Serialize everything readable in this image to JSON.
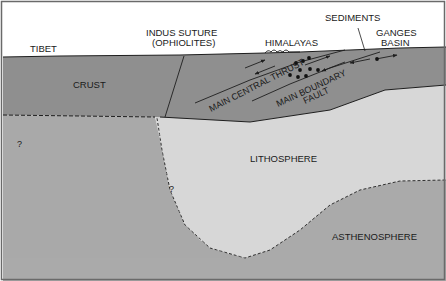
{
  "diagram": {
    "type": "geological cross-section",
    "colors": {
      "sky": "#ffffff",
      "crust": "#8f8f8f",
      "crust_dark": "#888888",
      "mantle_left": "#a9a9a9",
      "lithosphere": "#d7d7d7",
      "asthenosphere": "#aaaaaa",
      "line": "#1e1e1e",
      "frame": "#6a6a6a"
    },
    "surface_labels": {
      "tibet": "TIBET",
      "indus_suture_line1": "INDUS SUTURE",
      "indus_suture_line2": "(OPHIOLITES)",
      "himalayas": "HIMALAYAS",
      "sediments": "SEDIMENTS",
      "ganges_line1": "GANGES",
      "ganges_line2": "BASIN"
    },
    "region_labels": {
      "crust": "CRUST",
      "lithosphere": "LITHOSPHERE",
      "asthenosphere": "ASTHENOSPHERE"
    },
    "fault_labels": {
      "main_central_thrust": "MAIN CENTRAL THRUST",
      "main_boundary_line1": "MAIN BOUNDARY",
      "main_boundary_line2": "FAULT"
    },
    "uncertainty_marks": {
      "left": "?",
      "slab": "?"
    }
  }
}
